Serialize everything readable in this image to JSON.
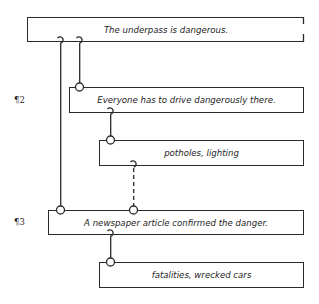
{
  "diagram": {
    "type": "argument-structure",
    "paragraph_labels": [
      {
        "id": "p2",
        "label": "¶2"
      },
      {
        "id": "p3",
        "label": "¶3"
      }
    ],
    "nodes": [
      {
        "id": "claim",
        "text": "The underpass is dangerous.",
        "level": 0
      },
      {
        "id": "reason1",
        "text": "Everyone has to drive dangerously there.",
        "level": 1,
        "paragraph": "¶2"
      },
      {
        "id": "evidence1",
        "text": "potholes, lighting",
        "level": 2
      },
      {
        "id": "reason2",
        "text": "A newspaper article confirmed the danger.",
        "level": 1,
        "paragraph": "¶3"
      },
      {
        "id": "evidence2",
        "text": "fatalities, wrecked cars",
        "level": 2
      }
    ],
    "edges": [
      {
        "from": "reason1",
        "to": "claim",
        "style": "solid"
      },
      {
        "from": "reason2",
        "to": "claim",
        "style": "solid"
      },
      {
        "from": "evidence1",
        "to": "reason1",
        "style": "solid"
      },
      {
        "from": "reason2",
        "to": "evidence1",
        "style": "dashed"
      },
      {
        "from": "evidence2",
        "to": "reason2",
        "style": "solid"
      }
    ],
    "colors": {
      "line": "#2a2a2a",
      "text": "#1e1e1e",
      "background": "#ffffff"
    }
  }
}
